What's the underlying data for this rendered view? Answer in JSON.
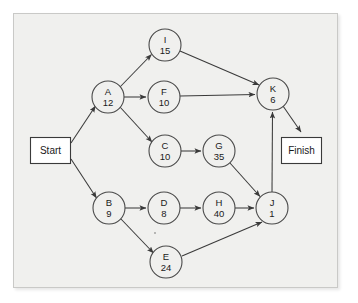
{
  "diagram": {
    "type": "activity-on-node-network",
    "colors": {
      "panel_background": "#f0f0ee",
      "panel_border": "#c9c9c7",
      "node_fill": "#f0f0ee",
      "node_stroke": "#4a4a4a",
      "edge_stroke": "#3a3a3a",
      "terminal_fill": "#ffffff",
      "text": "#1a1a1a"
    },
    "terminals": {
      "start": {
        "label": "Start",
        "x": 50,
        "y": 150.5,
        "w": 40,
        "h": 26
      },
      "finish": {
        "label": "Finish",
        "x": 301,
        "y": 150.5,
        "w": 40,
        "h": 26
      }
    },
    "nodes": [
      {
        "id": "I",
        "label": "I",
        "duration": "15",
        "cx": 165,
        "cy": 45,
        "r": 16
      },
      {
        "id": "A",
        "label": "A",
        "duration": "12",
        "cx": 108,
        "cy": 97,
        "r": 16
      },
      {
        "id": "F",
        "label": "F",
        "duration": "10",
        "cx": 164,
        "cy": 97,
        "r": 16
      },
      {
        "id": "K",
        "label": "K",
        "duration": "6",
        "cx": 273,
        "cy": 94,
        "r": 16
      },
      {
        "id": "C",
        "label": "C",
        "duration": "10",
        "cx": 165,
        "cy": 151,
        "r": 16
      },
      {
        "id": "G",
        "label": "G",
        "duration": "35",
        "cx": 219,
        "cy": 151,
        "r": 16
      },
      {
        "id": "B",
        "label": "B",
        "duration": "9",
        "cx": 109,
        "cy": 208,
        "r": 16
      },
      {
        "id": "D",
        "label": "D",
        "duration": "8",
        "cx": 164,
        "cy": 208,
        "r": 16
      },
      {
        "id": "H",
        "label": "H",
        "duration": "40",
        "cx": 219,
        "cy": 208,
        "r": 16
      },
      {
        "id": "J",
        "label": "J",
        "duration": "1",
        "cx": 272,
        "cy": 208,
        "r": 16
      },
      {
        "id": "E",
        "label": "E",
        "duration": "24",
        "cx": 166,
        "cy": 262,
        "r": 16
      }
    ],
    "edges": [
      {
        "from": "Start",
        "to": "A"
      },
      {
        "from": "Start",
        "to": "B"
      },
      {
        "from": "A",
        "to": "I"
      },
      {
        "from": "A",
        "to": "F"
      },
      {
        "from": "A",
        "to": "C"
      },
      {
        "from": "I",
        "to": "K"
      },
      {
        "from": "F",
        "to": "K"
      },
      {
        "from": "C",
        "to": "G"
      },
      {
        "from": "G",
        "to": "J"
      },
      {
        "from": "B",
        "to": "D"
      },
      {
        "from": "B",
        "to": "E"
      },
      {
        "from": "D",
        "to": "H"
      },
      {
        "from": "H",
        "to": "J"
      },
      {
        "from": "E",
        "to": "J"
      },
      {
        "from": "J",
        "to": "K"
      },
      {
        "from": "K",
        "to": "Finish"
      }
    ]
  }
}
